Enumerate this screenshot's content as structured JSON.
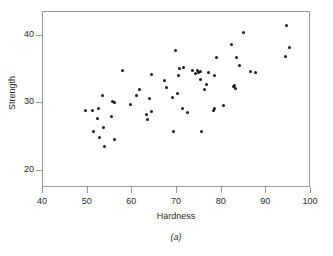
{
  "chart_data": {
    "type": "scatter",
    "title": "",
    "caption": "(a)",
    "xlabel": "Hardness",
    "ylabel": "Strength",
    "xlim": [
      40,
      100
    ],
    "ylim": [
      17.5,
      43.5
    ],
    "xticks": [
      40,
      50,
      60,
      70,
      80,
      90,
      100
    ],
    "yticks": [
      20,
      30,
      40
    ],
    "grid": false,
    "legend": null,
    "marker": {
      "shape": "circle",
      "color": "#1a1a1a",
      "size": 3
    },
    "points": [
      [
        49.6,
        28.9
      ],
      [
        51.0,
        29.0
      ],
      [
        51.2,
        25.9
      ],
      [
        52.1,
        27.7
      ],
      [
        52.4,
        29.2
      ],
      [
        52.6,
        24.9
      ],
      [
        53.3,
        31.1
      ],
      [
        53.6,
        26.4
      ],
      [
        53.8,
        23.7
      ],
      [
        55.3,
        28.1
      ],
      [
        55.5,
        30.3
      ],
      [
        55.9,
        30.2
      ],
      [
        56.0,
        24.7
      ],
      [
        57.8,
        34.8
      ],
      [
        59.7,
        29.8
      ],
      [
        60.9,
        31.2
      ],
      [
        61.5,
        32.1
      ],
      [
        63.2,
        28.3
      ],
      [
        63.5,
        27.6
      ],
      [
        63.8,
        30.7
      ],
      [
        64.2,
        28.8
      ],
      [
        64.4,
        34.3
      ],
      [
        67.2,
        33.4
      ],
      [
        67.6,
        32.4
      ],
      [
        69.1,
        30.9
      ],
      [
        69.3,
        25.8
      ],
      [
        69.6,
        37.8
      ],
      [
        70.1,
        31.5
      ],
      [
        70.3,
        34.1
      ],
      [
        70.6,
        35.2
      ],
      [
        71.2,
        29.3
      ],
      [
        71.4,
        35.3
      ],
      [
        72.3,
        28.7
      ],
      [
        73.4,
        34.9
      ],
      [
        74.2,
        34.4
      ],
      [
        74.6,
        34.8
      ],
      [
        74.9,
        34.6
      ],
      [
        75.2,
        34.7
      ],
      [
        75.3,
        33.6
      ],
      [
        75.5,
        25.8
      ],
      [
        76.2,
        32.1
      ],
      [
        76.5,
        32.8
      ],
      [
        77.1,
        34.5
      ],
      [
        78.1,
        28.9
      ],
      [
        78.3,
        29.2
      ],
      [
        78.5,
        34.1
      ],
      [
        78.8,
        36.8
      ],
      [
        80.4,
        29.7
      ],
      [
        82.2,
        38.7
      ],
      [
        82.6,
        32.5
      ],
      [
        82.8,
        32.7
      ],
      [
        83.0,
        32.2
      ],
      [
        83.4,
        36.8
      ],
      [
        84.1,
        35.6
      ],
      [
        84.8,
        40.5
      ],
      [
        86.5,
        34.7
      ],
      [
        87.5,
        34.5
      ],
      [
        94.2,
        36.9
      ],
      [
        94.5,
        41.5
      ],
      [
        95.2,
        38.2
      ]
    ]
  },
  "axes": {
    "ylabel": "Strength",
    "xlabel": "Hardness",
    "ytick_labels": [
      "20",
      "30",
      "40"
    ],
    "xtick_labels": [
      "40",
      "50",
      "60",
      "70",
      "80",
      "90",
      "100"
    ]
  },
  "figure": {
    "caption": "(a)",
    "background": "#ffffff",
    "frame_color": "#9a9a9a",
    "text_color": "#2b2b2b"
  }
}
